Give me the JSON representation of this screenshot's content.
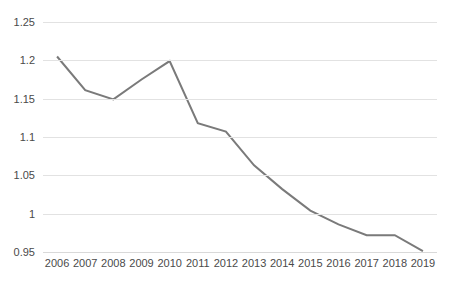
{
  "chart_data": {
    "type": "line",
    "title": "",
    "subtitle": "",
    "xlabel": "",
    "ylabel": "",
    "categories": [
      "2006",
      "2007",
      "2008",
      "2009",
      "2010",
      "2011",
      "2012",
      "2013",
      "2014",
      "2015",
      "2016",
      "2017",
      "2018",
      "2019"
    ],
    "values": [
      1.205,
      1.161,
      1.149,
      1.175,
      1.199,
      1.118,
      1.107,
      1.063,
      1.032,
      1.004,
      0.986,
      0.972,
      0.972,
      0.951
    ],
    "series": [
      {
        "name": "",
        "values": [
          1.205,
          1.161,
          1.149,
          1.175,
          1.199,
          1.118,
          1.107,
          1.063,
          1.032,
          1.004,
          0.986,
          0.972,
          0.972,
          0.951
        ]
      }
    ],
    "ylim": [
      0.95,
      1.25
    ],
    "ytick_labels": [
      "1.25",
      "1.2",
      "1.15",
      "1.1",
      "1.05",
      "1",
      "0.95"
    ],
    "ytick_values": [
      1.25,
      1.2,
      1.15,
      1.1,
      1.05,
      1.0,
      0.95
    ],
    "grid": true,
    "grid_axis": "y",
    "legend": false,
    "legend_position": "none",
    "markers": false,
    "line_color": "#7a7a7a",
    "grid_color": "#e2e2e2",
    "background_color": "#ffffff"
  }
}
